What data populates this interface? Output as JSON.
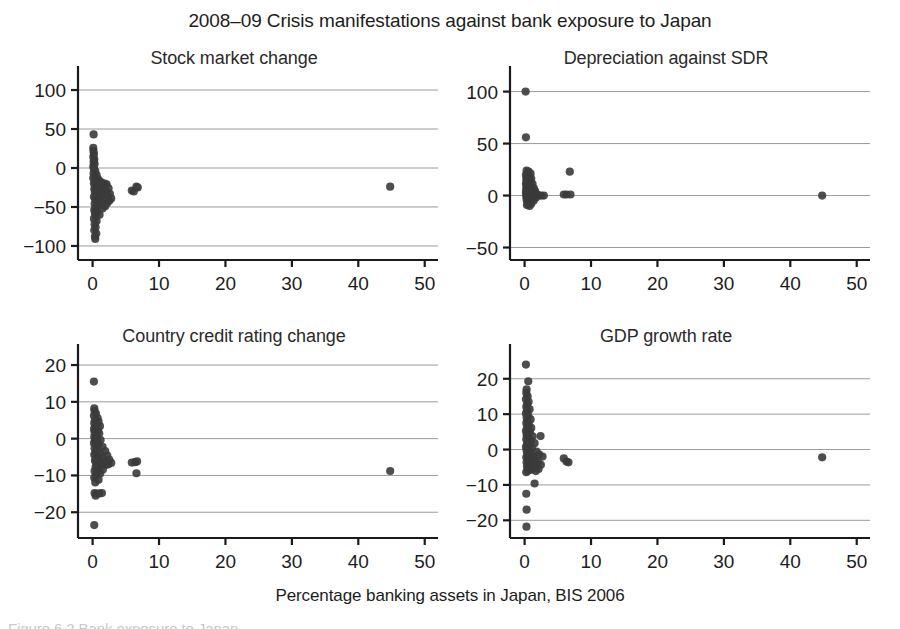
{
  "figure": {
    "title": "2008–09 Crisis manifestations against bank exposure to Japan",
    "x_axis_caption": "Percentage banking assets in Japan, BIS 2006",
    "caption": "Figure 6.2  Bank exposure to Japan",
    "point_color": "#3b3b3b",
    "axis_color": "#1a1a1a",
    "grid_color": "#9a9a9a"
  },
  "chart_data": [
    {
      "type": "scatter",
      "title": "Stock market change",
      "xlabel": "Percentage banking assets in Japan, BIS 2006",
      "ylabel": "",
      "xlim": [
        -2.2,
        52
      ],
      "ylim": [
        -118,
        118
      ],
      "xticks": [
        0,
        10,
        20,
        30,
        40,
        50
      ],
      "yticks": [
        100,
        50,
        0,
        -50,
        -100
      ],
      "xtick_labels": [
        "0",
        "10",
        "20",
        "30",
        "40",
        "50"
      ],
      "ytick_labels": [
        "100",
        "50",
        "0",
        "−50",
        "−100"
      ],
      "grid": "horizontal",
      "legend": "none",
      "points": [
        [
          0.15,
          43
        ],
        [
          0.1,
          26
        ],
        [
          0.12,
          22
        ],
        [
          0.2,
          18
        ],
        [
          0.1,
          14
        ],
        [
          0.25,
          11
        ],
        [
          0.15,
          8
        ],
        [
          0.3,
          5
        ],
        [
          0.1,
          2
        ],
        [
          0.2,
          -1
        ],
        [
          0.4,
          -4
        ],
        [
          0.15,
          -7
        ],
        [
          0.6,
          -9
        ],
        [
          0.3,
          -11
        ],
        [
          0.1,
          -13
        ],
        [
          0.8,
          -14
        ],
        [
          0.5,
          -16
        ],
        [
          1.1,
          -17
        ],
        [
          0.35,
          -18
        ],
        [
          1.4,
          -19
        ],
        [
          0.2,
          -20
        ],
        [
          1.8,
          -20
        ],
        [
          0.9,
          -22
        ],
        [
          2.1,
          -21
        ],
        [
          0.45,
          -24
        ],
        [
          1.3,
          -25
        ],
        [
          2.4,
          -26
        ],
        [
          0.25,
          -27
        ],
        [
          1.6,
          -28
        ],
        [
          0.7,
          -29
        ],
        [
          2.0,
          -30
        ],
        [
          0.35,
          -31
        ],
        [
          1.15,
          -32
        ],
        [
          2.6,
          -33
        ],
        [
          0.55,
          -34
        ],
        [
          1.45,
          -35
        ],
        [
          2.3,
          -36
        ],
        [
          0.2,
          -37
        ],
        [
          0.95,
          -38
        ],
        [
          2.8,
          -39
        ],
        [
          0.4,
          -40
        ],
        [
          1.7,
          -41
        ],
        [
          2.5,
          -42
        ],
        [
          0.6,
          -43
        ],
        [
          1.25,
          -44
        ],
        [
          2.2,
          -45
        ],
        [
          0.3,
          -46
        ],
        [
          0.85,
          -48
        ],
        [
          1.9,
          -49
        ],
        [
          0.45,
          -51
        ],
        [
          1.5,
          -52
        ],
        [
          0.25,
          -54
        ],
        [
          0.7,
          -56
        ],
        [
          0.35,
          -58
        ],
        [
          1.05,
          -60
        ],
        [
          0.5,
          -62
        ],
        [
          0.2,
          -65
        ],
        [
          0.6,
          -68
        ],
        [
          0.3,
          -72
        ],
        [
          0.45,
          -76
        ],
        [
          0.25,
          -80
        ],
        [
          0.55,
          -84
        ],
        [
          0.35,
          -88
        ],
        [
          0.4,
          -91
        ],
        [
          5.9,
          -29
        ],
        [
          6.2,
          -30
        ],
        [
          6.6,
          -24
        ],
        [
          6.8,
          -25
        ],
        [
          44.8,
          -24
        ]
      ]
    },
    {
      "type": "scatter",
      "title": "Depreciation against SDR",
      "xlabel": "Percentage banking assets in Japan, BIS 2006",
      "ylabel": "",
      "xlim": [
        -2.2,
        52
      ],
      "ylim": [
        -62,
        115
      ],
      "xticks": [
        0,
        10,
        20,
        30,
        40,
        50
      ],
      "yticks": [
        100,
        50,
        0,
        -50
      ],
      "xtick_labels": [
        "0",
        "10",
        "20",
        "30",
        "40",
        "50"
      ],
      "ytick_labels": [
        "100",
        "50",
        "0",
        "−50"
      ],
      "grid": "horizontal",
      "legend": "none",
      "points": [
        [
          0.15,
          100
        ],
        [
          0.2,
          56
        ],
        [
          0.3,
          24
        ],
        [
          0.6,
          23
        ],
        [
          0.45,
          22
        ],
        [
          0.9,
          21
        ],
        [
          0.2,
          20
        ],
        [
          0.35,
          19
        ],
        [
          0.75,
          18
        ],
        [
          0.5,
          17
        ],
        [
          0.25,
          16
        ],
        [
          1.0,
          16
        ],
        [
          0.4,
          15
        ],
        [
          0.65,
          14
        ],
        [
          0.3,
          13
        ],
        [
          0.85,
          13
        ],
        [
          0.5,
          12
        ],
        [
          0.2,
          11
        ],
        [
          1.2,
          11
        ],
        [
          0.7,
          10
        ],
        [
          0.4,
          9
        ],
        [
          0.95,
          9
        ],
        [
          0.3,
          8
        ],
        [
          0.55,
          7
        ],
        [
          1.4,
          7
        ],
        [
          0.8,
          6
        ],
        [
          0.25,
          6
        ],
        [
          0.45,
          5
        ],
        [
          1.1,
          5
        ],
        [
          0.65,
          4
        ],
        [
          0.35,
          4
        ],
        [
          1.6,
          4
        ],
        [
          0.9,
          3
        ],
        [
          0.2,
          3
        ],
        [
          0.5,
          2
        ],
        [
          1.3,
          2
        ],
        [
          0.75,
          2
        ],
        [
          0.3,
          1
        ],
        [
          1.9,
          1
        ],
        [
          1.05,
          1
        ],
        [
          0.55,
          0
        ],
        [
          2.1,
          0
        ],
        [
          0.4,
          0
        ],
        [
          1.5,
          0
        ],
        [
          0.85,
          -1
        ],
        [
          2.5,
          0
        ],
        [
          0.25,
          -1
        ],
        [
          1.2,
          -2
        ],
        [
          0.6,
          -2
        ],
        [
          2.9,
          0
        ],
        [
          0.45,
          -3
        ],
        [
          1.7,
          -2
        ],
        [
          0.95,
          -4
        ],
        [
          0.3,
          -4
        ],
        [
          1.35,
          -5
        ],
        [
          0.7,
          -6
        ],
        [
          0.5,
          -7
        ],
        [
          1.0,
          -8
        ],
        [
          0.35,
          -9
        ],
        [
          0.75,
          -10
        ],
        [
          5.9,
          1
        ],
        [
          6.3,
          1
        ],
        [
          6.8,
          23
        ],
        [
          6.9,
          1
        ],
        [
          44.8,
          0
        ]
      ]
    },
    {
      "type": "scatter",
      "title": "Country credit rating change",
      "xlabel": "Percentage banking assets in Japan, BIS 2006",
      "ylabel": "",
      "xlim": [
        -2.2,
        52
      ],
      "ylim": [
        -27,
        23
      ],
      "xticks": [
        0,
        10,
        20,
        30,
        40,
        50
      ],
      "yticks": [
        20,
        10,
        0,
        -10,
        -20
      ],
      "xtick_labels": [
        "0",
        "10",
        "20",
        "30",
        "40",
        "50"
      ],
      "ytick_labels": [
        "20",
        "10",
        "0",
        "−10",
        "−20"
      ],
      "grid": "horizontal",
      "legend": "none",
      "points": [
        [
          0.2,
          15.5
        ],
        [
          0.25,
          8.2
        ],
        [
          0.3,
          7.5
        ],
        [
          0.5,
          6.8
        ],
        [
          0.2,
          6.2
        ],
        [
          0.75,
          5.6
        ],
        [
          0.35,
          5.0
        ],
        [
          0.9,
          4.6
        ],
        [
          0.25,
          4.2
        ],
        [
          0.6,
          3.8
        ],
        [
          1.1,
          3.4
        ],
        [
          0.4,
          3.0
        ],
        [
          0.2,
          2.6
        ],
        [
          0.8,
          2.2
        ],
        [
          0.3,
          1.8
        ],
        [
          1.0,
          1.4
        ],
        [
          0.5,
          1.0
        ],
        [
          0.25,
          0.6
        ],
        [
          0.65,
          0.2
        ],
        [
          0.35,
          -0.2
        ],
        [
          1.2,
          -0.4
        ],
        [
          0.45,
          -0.8
        ],
        [
          0.2,
          -1.2
        ],
        [
          0.9,
          -1.5
        ],
        [
          0.55,
          -1.9
        ],
        [
          1.5,
          -2.2
        ],
        [
          0.3,
          -2.6
        ],
        [
          0.7,
          -3.0
        ],
        [
          1.9,
          -3.4
        ],
        [
          0.4,
          -3.7
        ],
        [
          1.1,
          -4.0
        ],
        [
          0.25,
          -4.4
        ],
        [
          2.2,
          -4.6
        ],
        [
          0.85,
          -4.9
        ],
        [
          1.4,
          -5.2
        ],
        [
          0.5,
          -5.5
        ],
        [
          2.5,
          -5.7
        ],
        [
          0.35,
          -6.0
        ],
        [
          1.7,
          -6.2
        ],
        [
          1.0,
          -6.5
        ],
        [
          2.8,
          -6.6
        ],
        [
          0.6,
          -6.9
        ],
        [
          2.0,
          -7.1
        ],
        [
          1.3,
          -7.4
        ],
        [
          0.45,
          -7.7
        ],
        [
          2.35,
          -7.0
        ],
        [
          0.8,
          -8.1
        ],
        [
          1.55,
          -8.4
        ],
        [
          0.3,
          -8.8
        ],
        [
          0.65,
          -9.2
        ],
        [
          1.15,
          -9.5
        ],
        [
          0.5,
          -10.1
        ],
        [
          0.25,
          -10.6
        ],
        [
          0.9,
          -11.2
        ],
        [
          0.4,
          -11.9
        ],
        [
          0.3,
          -14.8
        ],
        [
          0.6,
          -15.0
        ],
        [
          1.0,
          -14.9
        ],
        [
          1.4,
          -14.8
        ],
        [
          0.45,
          -15.5
        ],
        [
          0.25,
          -23.5
        ],
        [
          5.9,
          -6.5
        ],
        [
          6.4,
          -6.4
        ],
        [
          6.7,
          -6.2
        ],
        [
          6.6,
          -9.4
        ],
        [
          44.8,
          -8.8
        ]
      ]
    },
    {
      "type": "scatter",
      "title": "GDP growth rate",
      "xlabel": "Percentage banking assets in Japan, BIS 2006",
      "ylabel": "",
      "xlim": [
        -2.2,
        52
      ],
      "ylim": [
        -25,
        27
      ],
      "xticks": [
        0,
        10,
        20,
        30,
        40,
        50
      ],
      "yticks": [
        20,
        10,
        0,
        -10,
        -20
      ],
      "xtick_labels": [
        "0",
        "10",
        "20",
        "30",
        "40",
        "50"
      ],
      "ytick_labels": [
        "20",
        "10",
        "0",
        "−10",
        "−20"
      ],
      "grid": "horizontal",
      "legend": "none",
      "points": [
        [
          0.2,
          24
        ],
        [
          0.55,
          19.3
        ],
        [
          0.3,
          17
        ],
        [
          0.25,
          16
        ],
        [
          0.45,
          15
        ],
        [
          0.2,
          14.2
        ],
        [
          0.6,
          13.5
        ],
        [
          0.35,
          12.8
        ],
        [
          0.25,
          12.0
        ],
        [
          0.75,
          11.4
        ],
        [
          0.4,
          10.8
        ],
        [
          0.2,
          10.2
        ],
        [
          0.55,
          9.6
        ],
        [
          0.3,
          9.0
        ],
        [
          0.9,
          8.5
        ],
        [
          0.45,
          8.0
        ],
        [
          0.25,
          7.5
        ],
        [
          0.65,
          7.0
        ],
        [
          0.35,
          6.5
        ],
        [
          1.0,
          6.1
        ],
        [
          0.5,
          5.7
        ],
        [
          0.2,
          5.3
        ],
        [
          0.8,
          4.9
        ],
        [
          0.4,
          4.5
        ],
        [
          2.4,
          3.8
        ],
        [
          0.3,
          4.1
        ],
        [
          1.2,
          3.7
        ],
        [
          0.55,
          3.3
        ],
        [
          0.25,
          2.9
        ],
        [
          0.95,
          2.5
        ],
        [
          0.45,
          2.1
        ],
        [
          1.5,
          1.8
        ],
        [
          0.35,
          1.5
        ],
        [
          0.7,
          1.1
        ],
        [
          0.2,
          0.7
        ],
        [
          1.1,
          0.4
        ],
        [
          0.5,
          0.0
        ],
        [
          0.3,
          -0.3
        ],
        [
          1.8,
          -0.6
        ],
        [
          0.85,
          -0.9
        ],
        [
          0.4,
          -1.2
        ],
        [
          2.2,
          -1.4
        ],
        [
          0.6,
          -1.7
        ],
        [
          1.35,
          -1.9
        ],
        [
          0.25,
          -2.2
        ],
        [
          2.7,
          -2.0
        ],
        [
          1.0,
          -2.5
        ],
        [
          0.45,
          -2.8
        ],
        [
          1.6,
          -3.0
        ],
        [
          0.75,
          -3.3
        ],
        [
          0.3,
          -3.6
        ],
        [
          2.0,
          -3.5
        ],
        [
          1.25,
          -3.9
        ],
        [
          0.55,
          -4.2
        ],
        [
          0.9,
          -4.5
        ],
        [
          2.45,
          -4.3
        ],
        [
          0.35,
          -4.8
        ],
        [
          1.45,
          -5.0
        ],
        [
          0.65,
          -5.3
        ],
        [
          2.1,
          -5.5
        ],
        [
          1.05,
          -5.7
        ],
        [
          0.5,
          -6.0
        ],
        [
          0.25,
          -6.4
        ],
        [
          1.7,
          -6.1
        ],
        [
          1.5,
          -9.6
        ],
        [
          0.25,
          -12.5
        ],
        [
          0.3,
          -17.0
        ],
        [
          0.28,
          -21.8
        ],
        [
          5.9,
          -2.5
        ],
        [
          6.3,
          -3.4
        ],
        [
          6.6,
          -3.6
        ],
        [
          44.8,
          -2.2
        ]
      ]
    }
  ]
}
